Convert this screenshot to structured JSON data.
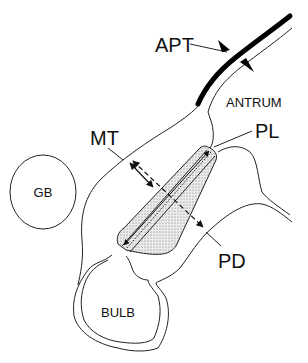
{
  "diagram": {
    "labels": {
      "apt": "APT",
      "antrum": "ANTRUM",
      "mt": "MT",
      "pl": "PL",
      "gb": "GB",
      "pd": "PD",
      "bulb": "BULB"
    },
    "colors": {
      "line": "#222222",
      "muscle": "#000000",
      "channel_fill": "#d8d8d8",
      "background": "#ffffff"
    }
  }
}
